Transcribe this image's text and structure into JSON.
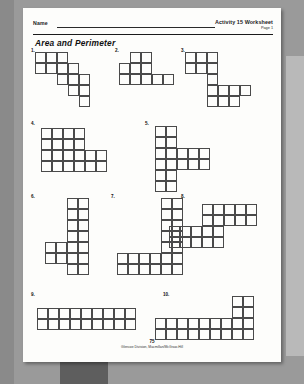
{
  "page": {
    "background_color": "#8a8a8a",
    "sheet_color": "#fdfdfb"
  },
  "header": {
    "name_label": "Name",
    "activity_title": "Activity 15 Worksheet",
    "page_label": "Page 1"
  },
  "worksheet": {
    "title": "Area and Perimeter"
  },
  "footer": {
    "page_number": "75",
    "credit": "Glencoe Division, Macmillan/McGraw-Hill"
  },
  "chart_data": {
    "type": "table",
    "title": "Area and Perimeter",
    "cell_size_px": 11,
    "problems": [
      {
        "number": "1.",
        "label_x": 8,
        "label_y": 40,
        "grid_x": 12,
        "grid_y": 44,
        "cols": 5,
        "rows": 5,
        "cells": [
          [
            0,
            0
          ],
          [
            0,
            1
          ],
          [
            1,
            0
          ],
          [
            1,
            1
          ],
          [
            2,
            0
          ],
          [
            2,
            1
          ],
          [
            2,
            2
          ],
          [
            3,
            1
          ],
          [
            3,
            2
          ],
          [
            3,
            3
          ],
          [
            4,
            2
          ],
          [
            4,
            3
          ],
          [
            4,
            4
          ]
        ],
        "filled_squares": 13
      },
      {
        "number": "2.",
        "label_x": 92,
        "label_y": 40,
        "grid_x": 96,
        "grid_y": 44,
        "cols": 5,
        "rows": 3,
        "cells": [
          [
            0,
            1
          ],
          [
            0,
            2
          ],
          [
            1,
            0
          ],
          [
            1,
            1
          ],
          [
            1,
            2
          ],
          [
            2,
            0
          ],
          [
            2,
            1
          ],
          [
            2,
            2
          ],
          [
            3,
            2
          ],
          [
            4,
            2
          ]
        ],
        "filled_squares": 10
      },
      {
        "number": "3.",
        "label_x": 158,
        "label_y": 40,
        "grid_x": 162,
        "grid_y": 44,
        "cols": 6,
        "rows": 5,
        "cells": [
          [
            0,
            0
          ],
          [
            0,
            1
          ],
          [
            1,
            0
          ],
          [
            1,
            1
          ],
          [
            2,
            0
          ],
          [
            2,
            1
          ],
          [
            2,
            2
          ],
          [
            2,
            3
          ],
          [
            2,
            4
          ],
          [
            3,
            3
          ],
          [
            3,
            4
          ],
          [
            4,
            3
          ],
          [
            4,
            4
          ],
          [
            5,
            3
          ]
        ],
        "filled_squares": 14
      },
      {
        "number": "4.",
        "label_x": 8,
        "label_y": 113,
        "grid_x": 18,
        "grid_y": 120,
        "cols": 6,
        "rows": 4,
        "cells": [
          [
            0,
            0
          ],
          [
            0,
            1
          ],
          [
            0,
            2
          ],
          [
            0,
            3
          ],
          [
            1,
            0
          ],
          [
            1,
            1
          ],
          [
            1,
            2
          ],
          [
            1,
            3
          ],
          [
            2,
            0
          ],
          [
            2,
            1
          ],
          [
            2,
            2
          ],
          [
            2,
            3
          ],
          [
            3,
            0
          ],
          [
            3,
            1
          ],
          [
            3,
            2
          ],
          [
            3,
            3
          ],
          [
            4,
            2
          ],
          [
            4,
            3
          ],
          [
            5,
            2
          ],
          [
            5,
            3
          ]
        ],
        "filled_squares": 20
      },
      {
        "number": "5.",
        "label_x": 122,
        "label_y": 113,
        "grid_x": 132,
        "grid_y": 118,
        "cols": 5,
        "rows": 6,
        "cells": [
          [
            0,
            0
          ],
          [
            0,
            1
          ],
          [
            0,
            2
          ],
          [
            0,
            3
          ],
          [
            0,
            4
          ],
          [
            0,
            5
          ],
          [
            1,
            0
          ],
          [
            1,
            1
          ],
          [
            1,
            2
          ],
          [
            1,
            3
          ],
          [
            1,
            4
          ],
          [
            1,
            5
          ],
          [
            2,
            2
          ],
          [
            2,
            3
          ],
          [
            3,
            2
          ],
          [
            3,
            3
          ],
          [
            4,
            2
          ],
          [
            4,
            3
          ]
        ],
        "filled_squares": 18
      },
      {
        "number": "6.",
        "label_x": 8,
        "label_y": 186,
        "grid_x": 22,
        "grid_y": 190,
        "cols": 4,
        "rows": 7,
        "cells": [
          [
            2,
            0
          ],
          [
            2,
            1
          ],
          [
            2,
            2
          ],
          [
            2,
            3
          ],
          [
            2,
            4
          ],
          [
            2,
            5
          ],
          [
            2,
            6
          ],
          [
            3,
            0
          ],
          [
            3,
            1
          ],
          [
            3,
            2
          ],
          [
            3,
            3
          ],
          [
            3,
            4
          ],
          [
            3,
            5
          ],
          [
            3,
            6
          ],
          [
            0,
            4
          ],
          [
            0,
            5
          ],
          [
            1,
            4
          ],
          [
            1,
            5
          ]
        ],
        "filled_squares": 18
      },
      {
        "number": "7.",
        "label_x": 88,
        "label_y": 186,
        "grid_x": 94,
        "grid_y": 190,
        "cols": 6,
        "rows": 7,
        "cells": [
          [
            4,
            0
          ],
          [
            4,
            1
          ],
          [
            4,
            2
          ],
          [
            4,
            3
          ],
          [
            4,
            4
          ],
          [
            4,
            5
          ],
          [
            4,
            6
          ],
          [
            5,
            0
          ],
          [
            5,
            1
          ],
          [
            5,
            2
          ],
          [
            5,
            3
          ],
          [
            5,
            4
          ],
          [
            5,
            5
          ],
          [
            5,
            6
          ],
          [
            0,
            5
          ],
          [
            0,
            6
          ],
          [
            1,
            5
          ],
          [
            1,
            6
          ],
          [
            2,
            5
          ],
          [
            2,
            6
          ],
          [
            3,
            5
          ],
          [
            3,
            6
          ]
        ],
        "filled_squares": 22
      },
      {
        "number": "8.",
        "label_x": 158,
        "label_y": 186,
        "grid_x": 146,
        "grid_y": 196,
        "cols": 8,
        "rows": 4,
        "cells": [
          [
            3,
            0
          ],
          [
            3,
            1
          ],
          [
            4,
            0
          ],
          [
            4,
            1
          ],
          [
            5,
            0
          ],
          [
            5,
            1
          ],
          [
            6,
            0
          ],
          [
            6,
            1
          ],
          [
            7,
            0
          ],
          [
            7,
            1
          ],
          [
            0,
            2
          ],
          [
            0,
            3
          ],
          [
            1,
            2
          ],
          [
            1,
            3
          ],
          [
            2,
            2
          ],
          [
            2,
            3
          ],
          [
            3,
            2
          ],
          [
            3,
            3
          ],
          [
            4,
            2
          ],
          [
            4,
            3
          ]
        ],
        "filled_squares": 20
      },
      {
        "number": "9.",
        "label_x": 8,
        "label_y": 284,
        "grid_x": 14,
        "grid_y": 300,
        "cols": 9,
        "rows": 2,
        "cells": [
          [
            0,
            0
          ],
          [
            0,
            1
          ],
          [
            1,
            0
          ],
          [
            1,
            1
          ],
          [
            2,
            0
          ],
          [
            2,
            1
          ],
          [
            3,
            0
          ],
          [
            3,
            1
          ],
          [
            4,
            0
          ],
          [
            4,
            1
          ],
          [
            5,
            0
          ],
          [
            5,
            1
          ],
          [
            6,
            0
          ],
          [
            6,
            1
          ],
          [
            7,
            0
          ],
          [
            7,
            1
          ],
          [
            8,
            0
          ],
          [
            8,
            1
          ]
        ],
        "filled_squares": 18
      },
      {
        "number": "10.",
        "label_x": 140,
        "label_y": 284,
        "grid_x": 132,
        "grid_y": 288,
        "cols": 9,
        "rows": 4,
        "cells": [
          [
            7,
            0
          ],
          [
            7,
            1
          ],
          [
            8,
            0
          ],
          [
            8,
            1
          ],
          [
            0,
            2
          ],
          [
            0,
            3
          ],
          [
            1,
            2
          ],
          [
            1,
            3
          ],
          [
            2,
            2
          ],
          [
            2,
            3
          ],
          [
            3,
            2
          ],
          [
            3,
            3
          ],
          [
            4,
            2
          ],
          [
            4,
            3
          ],
          [
            5,
            2
          ],
          [
            5,
            3
          ],
          [
            6,
            2
          ],
          [
            6,
            3
          ],
          [
            7,
            2
          ],
          [
            7,
            3
          ],
          [
            8,
            2
          ],
          [
            8,
            3
          ]
        ],
        "filled_squares": 22
      }
    ]
  }
}
